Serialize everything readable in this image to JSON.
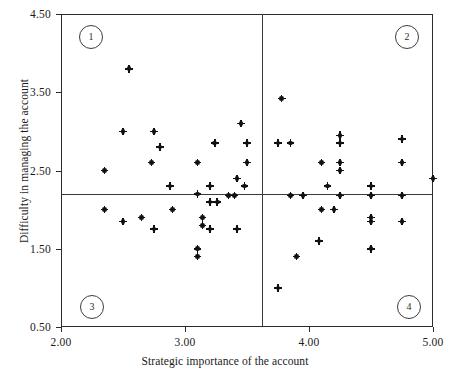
{
  "chart_data": {
    "type": "scatter",
    "title": "",
    "xlabel": "Strategic importance of the account",
    "ylabel": "Difficulty in managing the account",
    "xlim": [
      2.0,
      5.0
    ],
    "ylim": [
      0.5,
      4.5
    ],
    "xticks": [
      "2.00",
      "3.00",
      "4.00",
      "5.00"
    ],
    "xtick_values": [
      2.0,
      3.0,
      4.0,
      5.0
    ],
    "yticks": [
      "0.50",
      "1.50",
      "2.50",
      "3.50",
      "4.50"
    ],
    "ytick_values": [
      0.5,
      1.5,
      2.5,
      3.5,
      4.5
    ],
    "grid": false,
    "legend": "none",
    "reference_lines": {
      "vertical_x": 3.62,
      "horizontal_y": 2.2
    },
    "quadrant_labels": [
      {
        "id": "1",
        "corner": "top-left"
      },
      {
        "id": "2",
        "corner": "top-right"
      },
      {
        "id": "3",
        "corner": "bottom-left"
      },
      {
        "id": "4",
        "corner": "bottom-right"
      }
    ],
    "points": [
      [
        2.55,
        3.8
      ],
      [
        2.5,
        3.0
      ],
      [
        2.75,
        3.0
      ],
      [
        3.24,
        2.85
      ],
      [
        3.45,
        3.1
      ],
      [
        3.5,
        2.85
      ],
      [
        2.8,
        2.8
      ],
      [
        2.73,
        2.6
      ],
      [
        3.1,
        2.6
      ],
      [
        3.5,
        2.6
      ],
      [
        2.35,
        2.5
      ],
      [
        3.42,
        2.4
      ],
      [
        2.88,
        2.3
      ],
      [
        3.2,
        2.3
      ],
      [
        3.48,
        2.3
      ],
      [
        3.1,
        2.2
      ],
      [
        3.35,
        2.18
      ],
      [
        3.4,
        2.18
      ],
      [
        3.2,
        2.1
      ],
      [
        3.26,
        2.1
      ],
      [
        2.35,
        2.0
      ],
      [
        2.9,
        2.0
      ],
      [
        2.5,
        1.85
      ],
      [
        2.65,
        1.9
      ],
      [
        3.14,
        1.9
      ],
      [
        3.14,
        1.8
      ],
      [
        2.75,
        1.75
      ],
      [
        3.2,
        1.75
      ],
      [
        3.42,
        1.75
      ],
      [
        3.1,
        1.5
      ],
      [
        3.1,
        1.4
      ],
      [
        3.78,
        3.42
      ],
      [
        3.75,
        2.85
      ],
      [
        3.85,
        2.85
      ],
      [
        4.25,
        2.95
      ],
      [
        4.25,
        2.85
      ],
      [
        4.1,
        2.6
      ],
      [
        4.25,
        2.6
      ],
      [
        4.75,
        2.9
      ],
      [
        4.25,
        2.5
      ],
      [
        4.75,
        2.6
      ],
      [
        4.15,
        2.3
      ],
      [
        4.5,
        2.3
      ],
      [
        5.0,
        2.4
      ],
      [
        3.85,
        2.18
      ],
      [
        3.95,
        2.18
      ],
      [
        4.25,
        2.18
      ],
      [
        4.5,
        2.18
      ],
      [
        4.75,
        2.18
      ],
      [
        4.1,
        2.0
      ],
      [
        4.2,
        2.0
      ],
      [
        4.5,
        1.9
      ],
      [
        4.5,
        1.85
      ],
      [
        4.75,
        1.85
      ],
      [
        4.08,
        1.6
      ],
      [
        3.9,
        1.4
      ],
      [
        4.5,
        1.5
      ],
      [
        3.75,
        1.0
      ]
    ]
  },
  "axis": {
    "x_title": "Strategic importance of the account",
    "y_title": "Difficulty in managing the account",
    "x_ticks": [
      "2.00",
      "3.00",
      "4.00",
      "5.00"
    ],
    "y_ticks": [
      "4.50",
      "3.50",
      "2.50",
      "1.50",
      "0.50"
    ]
  },
  "quadrants": {
    "q1": "1",
    "q2": "2",
    "q3": "3",
    "q4": "4"
  },
  "colors": {
    "point": "#111111",
    "frame": "#2b2b2b",
    "divider": "#3a3a3a",
    "background": "#ffffff",
    "text": "#1a1a1a"
  }
}
